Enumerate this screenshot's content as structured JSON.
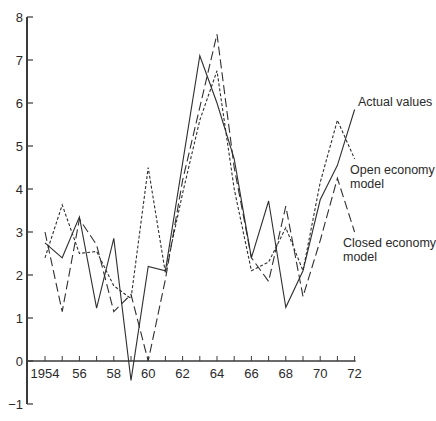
{
  "chart_data": {
    "type": "line",
    "title": "",
    "xlabel": "",
    "ylabel": "",
    "xlim": [
      1954,
      1972
    ],
    "ylim": [
      -1,
      8
    ],
    "grid": false,
    "legend": "direct labels at right end of lines",
    "x": [
      1954,
      1955,
      1956,
      1957,
      1958,
      1959,
      1960,
      1961,
      1962,
      1963,
      1964,
      1965,
      1966,
      1967,
      1968,
      1969,
      1970,
      1971
    ],
    "x_tick_labels": [
      "1954",
      "56",
      "58",
      "60",
      "62",
      "64",
      "66",
      "68",
      "70",
      "72"
    ],
    "x_tick_values": [
      1954,
      1956,
      1958,
      1960,
      1962,
      1964,
      1966,
      1968,
      1970,
      1972
    ],
    "y_tick_labels": [
      "−1",
      "0",
      "1",
      "2",
      "3",
      "4",
      "5",
      "6",
      "7",
      "8"
    ],
    "y_tick_values": [
      -1,
      0,
      1,
      2,
      3,
      4,
      5,
      6,
      7,
      8
    ],
    "series": [
      {
        "name": "Actual values",
        "style": "solid",
        "values": [
          2.75,
          2.4,
          3.35,
          1.23,
          2.85,
          -0.45,
          2.2,
          2.1,
          4.6,
          7.1,
          6.0,
          4.7,
          2.4,
          3.72,
          1.25,
          2.1,
          3.75,
          4.55
        ],
        "label_leader_end": [
          1972,
          5.85
        ]
      },
      {
        "name": "Open economy model",
        "style": "short-dash",
        "values": [
          2.4,
          3.63,
          2.5,
          2.55,
          1.75,
          1.45,
          4.5,
          2.05,
          3.9,
          5.6,
          6.75,
          4.0,
          2.1,
          2.3,
          3.1,
          2.1,
          4.15,
          5.6
        ],
        "label_leader_end": [
          1972,
          4.7
        ]
      },
      {
        "name": "Closed economy model",
        "style": "long-dash",
        "values": [
          3.0,
          1.15,
          3.3,
          2.7,
          1.15,
          1.55,
          0.0,
          1.9,
          4.2,
          5.9,
          7.6,
          4.5,
          2.4,
          1.85,
          3.6,
          1.5,
          2.8,
          4.25
        ],
        "label_leader_end": [
          1972,
          3.0
        ]
      }
    ],
    "annotations": [
      {
        "text": "Actual values",
        "lines": [
          "Actual values"
        ]
      },
      {
        "text": "Open economy model",
        "lines": [
          "Open economy",
          "model"
        ]
      },
      {
        "text": "Closed economy model",
        "lines": [
          "Closed economy",
          "model"
        ]
      }
    ]
  },
  "labels": {
    "actual": [
      "Actual values"
    ],
    "open": [
      "Open economy",
      "model"
    ],
    "closed": [
      "Closed economy",
      "model"
    ]
  }
}
